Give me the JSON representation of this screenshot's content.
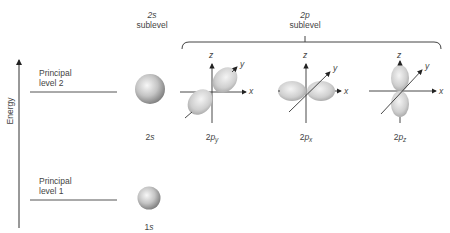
{
  "energy_axis": {
    "label": "Energy"
  },
  "levels": [
    {
      "line1": "Principal",
      "line2": "level 2",
      "n": 2
    },
    {
      "line1": "Principal",
      "line2": "level 1",
      "n": 1
    }
  ],
  "sublevels": {
    "s2": {
      "top": "2s",
      "bottom": "sublevel"
    },
    "p2": {
      "top": "2p",
      "bottom": "sublevel"
    }
  },
  "orbitals": {
    "s2": {
      "prefix": "2",
      "letter": "s"
    },
    "s1": {
      "prefix": "1",
      "letter": "s"
    },
    "py": {
      "prefix": "2",
      "letter": "p",
      "sub": "y"
    },
    "px": {
      "prefix": "2",
      "letter": "p",
      "sub": "x"
    },
    "pz": {
      "prefix": "2",
      "letter": "p",
      "sub": "z"
    }
  },
  "axes": {
    "x": "x",
    "y": "y",
    "z": "z"
  },
  "colors": {
    "line": "#555555",
    "orbital_light": "#f2f2f2",
    "orbital_dark": "#8a8a8a"
  }
}
